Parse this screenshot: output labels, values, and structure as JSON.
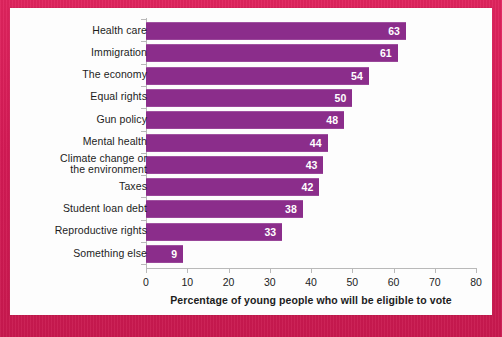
{
  "chart_data": {
    "type": "bar",
    "orientation": "horizontal",
    "title": "",
    "xlabel": "Percentage of young people who will be eligible to vote",
    "ylabel": "",
    "xlim": [
      0,
      80
    ],
    "xticks": [
      0,
      10,
      20,
      30,
      40,
      50,
      60,
      70,
      80
    ],
    "xtick_labels": [
      "0",
      "10",
      "20",
      "30",
      "40",
      "50",
      "60",
      "70",
      "80"
    ],
    "grid": false,
    "legend": null,
    "bar_color": "#8b2d8b",
    "value_label_color": "#ffffff",
    "background_color": "#d81b56",
    "panel_color": "#fdfdfd",
    "categories": [
      "Health care",
      "Immigration",
      "The economy",
      "Equal rights",
      "Gun policy",
      "Mental health",
      "Climate change or the environment",
      "Taxes",
      "Student loan debt",
      "Reproductive rights",
      "Something else"
    ],
    "category_lines": [
      [
        "Health care"
      ],
      [
        "Immigration"
      ],
      [
        "The economy"
      ],
      [
        "Equal rights"
      ],
      [
        "Gun policy"
      ],
      [
        "Mental health"
      ],
      [
        "Climate change or",
        "the environment"
      ],
      [
        "Taxes"
      ],
      [
        "Student loan debt"
      ],
      [
        "Reproductive rights"
      ],
      [
        "Something else"
      ]
    ],
    "values": [
      63,
      61,
      54,
      50,
      48,
      44,
      43,
      42,
      38,
      33,
      9
    ],
    "value_labels": [
      "63",
      "61",
      "54",
      "50",
      "48",
      "44",
      "43",
      "42",
      "38",
      "33",
      "9"
    ]
  }
}
